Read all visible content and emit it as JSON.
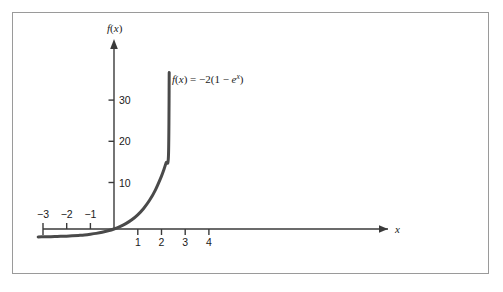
{
  "chart_data": {
    "type": "line",
    "title": "",
    "subtitle": "",
    "xlabel": "x",
    "ylabel": "f(x)",
    "xlim": [
      -3.4,
      4.6
    ],
    "ylim": [
      -3.5,
      39
    ],
    "grid": false,
    "legend_position": "none",
    "annotations": [
      {
        "name": "function-equation",
        "parts": {
          "f": "f",
          "open_paren": "(",
          "var": "x",
          "close_paren": ")",
          "equals": " = ",
          "coefficient": "−2(1 − ",
          "e": "e",
          "exponent": "x",
          "tail": ")"
        },
        "plain_text": "f(x) = −2(1 − e^x)",
        "x": 2.45,
        "y": 33.5
      }
    ],
    "x_ticks": [
      {
        "value": -3,
        "label": "−3",
        "side": "above"
      },
      {
        "value": -2,
        "label": "−2",
        "side": "above"
      },
      {
        "value": -1,
        "label": "−1",
        "side": "above"
      },
      {
        "value": 1,
        "label": "1",
        "side": "below"
      },
      {
        "value": 2,
        "label": "2",
        "side": "below"
      },
      {
        "value": 3,
        "label": "3",
        "side": "below"
      },
      {
        "value": 4,
        "label": "4",
        "side": "below"
      }
    ],
    "y_ticks": [
      {
        "value": 10,
        "label": "10"
      },
      {
        "value": 20,
        "label": "20"
      },
      {
        "value": 30,
        "label": "30"
      }
    ],
    "series": [
      {
        "name": "f(x) = −2(1 − e^x)",
        "formula": "-2*(1 - exp(x))",
        "color": "#4a4a4a",
        "line_width": 3,
        "x_start": -3.2,
        "x_end": 2.33,
        "points": [
          {
            "x": -3.2,
            "y": -1.92
          },
          {
            "x": -3.0,
            "y": -1.9
          },
          {
            "x": -2.75,
            "y": -1.87
          },
          {
            "x": -2.5,
            "y": -1.84
          },
          {
            "x": -2.25,
            "y": -1.79
          },
          {
            "x": -2.0,
            "y": -1.73
          },
          {
            "x": -1.75,
            "y": -1.65
          },
          {
            "x": -1.5,
            "y": -1.55
          },
          {
            "x": -1.25,
            "y": -1.43
          },
          {
            "x": -1.0,
            "y": -1.26
          },
          {
            "x": -0.75,
            "y": -1.06
          },
          {
            "x": -0.5,
            "y": -0.79
          },
          {
            "x": -0.25,
            "y": -0.44
          },
          {
            "x": 0.0,
            "y": 0.0
          },
          {
            "x": 0.25,
            "y": 0.57
          },
          {
            "x": 0.5,
            "y": 1.3
          },
          {
            "x": 0.75,
            "y": 2.23
          },
          {
            "x": 1.0,
            "y": 3.44
          },
          {
            "x": 1.25,
            "y": 4.99
          },
          {
            "x": 1.5,
            "y": 6.96
          },
          {
            "x": 1.75,
            "y": 9.51
          },
          {
            "x": 2.0,
            "y": 12.78
          },
          {
            "x": 2.1,
            "y": 14.34
          },
          {
            "x": 2.2,
            "y": 16.1
          },
          {
            "x": 2.3,
            "y": 18.07
          },
          {
            "x": 2.33,
            "y": 38.0
          }
        ]
      }
    ],
    "asymptote": {
      "name": "horizontal-asymptote",
      "value": -2
    }
  },
  "axes": {
    "x_axis_label": "x",
    "y_axis_label": "f(x)",
    "x_axis_arrow": "arrow-right",
    "y_axis_arrow": "arrow-up"
  },
  "colors": {
    "curve": "#4a4a4a",
    "axis": "#3a3a3a",
    "frame_border": "#9a9a9a",
    "background": "#ffffff",
    "text": "#1a1a1a"
  }
}
